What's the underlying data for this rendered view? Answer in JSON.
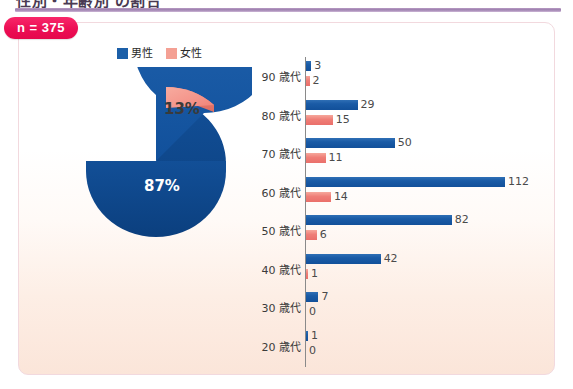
{
  "header": {
    "title_partial": "性別・年齢別 の割合",
    "rule_color": "#9c7fae"
  },
  "badge": {
    "label": "n = 375",
    "color": "#ec0e54"
  },
  "legend": {
    "items": [
      {
        "label": "男性",
        "color": "#1c5fa8",
        "icon": "square-swatch"
      },
      {
        "label": "女性",
        "color": "#f4a094",
        "icon": "square-swatch"
      }
    ]
  },
  "chart_data": [
    {
      "type": "pie",
      "title": "",
      "labels": [
        "男性",
        "女性"
      ],
      "values": [
        87,
        13
      ],
      "display_labels": [
        "87%",
        "13%"
      ],
      "colors": [
        "#1a5ba6",
        "#f4948a"
      ],
      "exploded_slice": "女性",
      "legend_position": "top",
      "style": "3d"
    },
    {
      "type": "bar",
      "orientation": "horizontal",
      "title": "",
      "xlabel": "",
      "ylabel": "",
      "categories": [
        "90 歳代",
        "80 歳代",
        "70 歳代",
        "60 歳代",
        "50 歳代",
        "40 歳代",
        "30 歳代",
        "20 歳代"
      ],
      "series": [
        {
          "name": "男性",
          "color": "#1a5ba6",
          "values": [
            3,
            29,
            50,
            112,
            82,
            42,
            7,
            1
          ]
        },
        {
          "name": "女性",
          "color": "#ef7e77",
          "values": [
            2,
            15,
            11,
            14,
            6,
            1,
            0,
            0
          ]
        }
      ],
      "xlim": [
        0,
        112
      ],
      "grid": false,
      "legend_position": "top",
      "data_labels": true
    }
  ]
}
